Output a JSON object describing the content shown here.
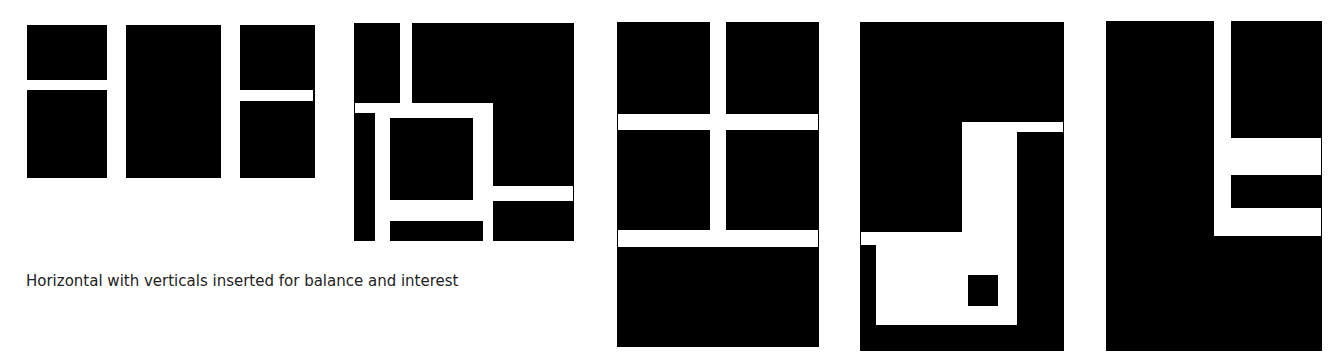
{
  "caption": "Horizontal with verticals inserted for balance and interest",
  "colors": {
    "background": "#ffffff",
    "block": "#000000",
    "text": "#222222"
  },
  "figures": [
    {
      "id": "figure-1",
      "orientation": "horizontal",
      "description": "two vertical white bars with opposing horizontal stubs"
    },
    {
      "id": "figure-2",
      "orientation": "square",
      "description": "white grid of bars framing a central black square"
    },
    {
      "id": "figure-3",
      "orientation": "vertical",
      "description": "cross-like grid with one vertical and two horizontal white bars"
    },
    {
      "id": "figure-4",
      "orientation": "vertical",
      "description": "large white L-shaped field with small black square inside"
    },
    {
      "id": "figure-5",
      "orientation": "vertical",
      "description": "vertical white bar with two horizontal bars forming an E-like shape"
    }
  ]
}
